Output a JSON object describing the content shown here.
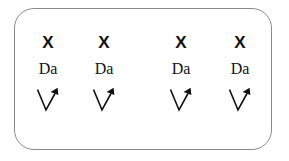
{
  "panel": {
    "border_color": "#8a8a8a",
    "background_color": "#ffffff",
    "symbol_color": "#111111"
  },
  "columns": [
    {
      "mark": "X",
      "label": "Da",
      "arrow": "v-arrow-up-right",
      "center_x": 48
    },
    {
      "mark": "X",
      "label": "Da",
      "arrow": "v-arrow-up-right",
      "center_x": 104
    },
    {
      "mark": "X",
      "label": "Da",
      "arrow": "v-arrow-up-right",
      "center_x": 181
    },
    {
      "mark": "X",
      "label": "Da",
      "arrow": "v-arrow-up-right",
      "center_x": 240
    }
  ]
}
